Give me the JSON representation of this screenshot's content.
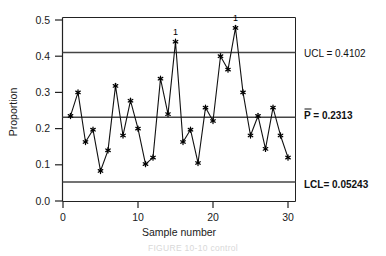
{
  "chart_data": {
    "type": "line",
    "title": "",
    "xlabel": "Sample number",
    "ylabel": "Proportion",
    "xlim": [
      0,
      31
    ],
    "ylim": [
      0.0,
      0.52
    ],
    "grid": false,
    "legend": "none",
    "x_ticks": [
      "0",
      "10",
      "20",
      "30"
    ],
    "x_tick_values": [
      0,
      10,
      20,
      30
    ],
    "y_ticks": [
      "0.0",
      "0.1",
      "0.2",
      "0.3",
      "0.4",
      "0.5"
    ],
    "y_tick_values": [
      0.0,
      0.1,
      0.2,
      0.3,
      0.4,
      0.5
    ],
    "x": [
      1,
      2,
      3,
      4,
      5,
      6,
      7,
      8,
      9,
      10,
      11,
      12,
      13,
      14,
      15,
      16,
      17,
      18,
      19,
      20,
      21,
      22,
      23,
      24,
      25,
      26,
      27,
      28,
      29,
      30
    ],
    "values": [
      0.235,
      0.3,
      0.163,
      0.197,
      0.083,
      0.14,
      0.318,
      0.181,
      0.277,
      0.2,
      0.102,
      0.12,
      0.338,
      0.24,
      0.44,
      0.163,
      0.197,
      0.105,
      0.258,
      0.221,
      0.4,
      0.363,
      0.478,
      0.3,
      0.181,
      0.235,
      0.144,
      0.258,
      0.181,
      0.12
    ],
    "series": [
      {
        "name": "Proportion",
        "values": [
          0.235,
          0.3,
          0.163,
          0.197,
          0.083,
          0.14,
          0.318,
          0.181,
          0.277,
          0.2,
          0.102,
          0.12,
          0.338,
          0.24,
          0.44,
          0.163,
          0.197,
          0.105,
          0.258,
          0.221,
          0.4,
          0.363,
          0.478,
          0.3,
          0.181,
          0.235,
          0.144,
          0.258,
          0.181,
          0.12
        ]
      }
    ],
    "control_limits": {
      "ucl": 0.4102,
      "center": 0.2313,
      "lcl": 0.05243
    },
    "annotations": [
      {
        "label": "1",
        "x": 15,
        "y": 0.44
      },
      {
        "label": "1",
        "x": 23,
        "y": 0.478
      }
    ]
  },
  "labels": {
    "ucl": "UCL = 0.4102",
    "center": "P = 0.2313",
    "center_prefix": "P",
    "center_suffix": " = 0.2313",
    "lcl": "LCL= 0.05243",
    "x_axis_title": "Sample number",
    "y_axis_title": "Proportion"
  },
  "caption": {
    "text": "FIGURE 10-10 control"
  },
  "colors": {
    "line": "#111111",
    "marker": "#000000",
    "limit_line": "#444444",
    "axis": "#222222",
    "background": "#ffffff"
  }
}
